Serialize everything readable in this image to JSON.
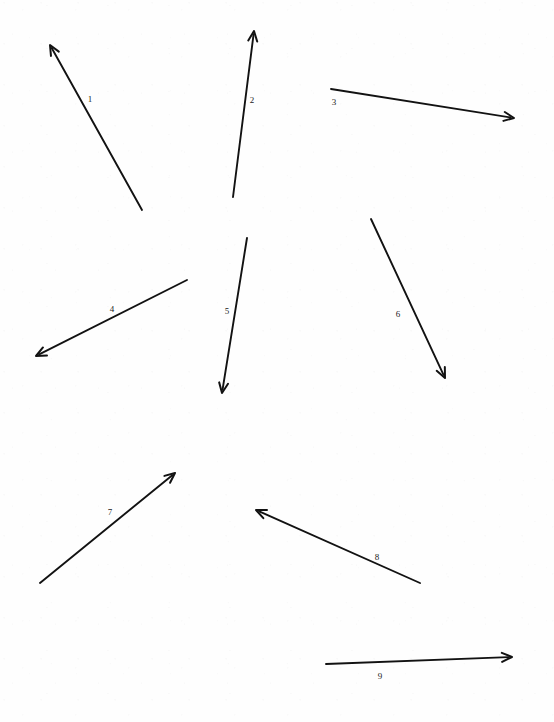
{
  "page": {
    "background_color": "#fefefe",
    "stroke_color": "#121212",
    "width": 554,
    "height": 722
  },
  "arrows": [
    {
      "id": "arrow-1",
      "label": "1",
      "label_x": 90,
      "label_y": 99,
      "tail_x": 142,
      "tail_y": 210,
      "head_x": 50,
      "head_y": 45,
      "direction": "up-left"
    },
    {
      "id": "arrow-2",
      "label": "2",
      "label_x": 252,
      "label_y": 100,
      "tail_x": 233,
      "tail_y": 197,
      "head_x": 254,
      "head_y": 31,
      "direction": "up"
    },
    {
      "id": "arrow-3",
      "label": "3",
      "label_x": 334,
      "label_y": 102,
      "tail_x": 331,
      "tail_y": 89,
      "head_x": 514,
      "head_y": 118,
      "direction": "right-down"
    },
    {
      "id": "arrow-4",
      "label": "4",
      "label_x": 112,
      "label_y": 309,
      "tail_x": 187,
      "tail_y": 280,
      "head_x": 36,
      "head_y": 356,
      "direction": "down-left"
    },
    {
      "id": "arrow-5",
      "label": "5",
      "label_x": 227,
      "label_y": 311,
      "tail_x": 247,
      "tail_y": 238,
      "head_x": 222,
      "head_y": 393,
      "direction": "down"
    },
    {
      "id": "arrow-6",
      "label": "6",
      "label_x": 398,
      "label_y": 314,
      "tail_x": 371,
      "tail_y": 219,
      "head_x": 445,
      "head_y": 378,
      "direction": "down-right"
    },
    {
      "id": "arrow-7",
      "label": "7",
      "label_x": 110,
      "label_y": 512,
      "tail_x": 40,
      "tail_y": 583,
      "head_x": 175,
      "head_y": 473,
      "direction": "up-right"
    },
    {
      "id": "arrow-8",
      "label": "8",
      "label_x": 377,
      "label_y": 557,
      "tail_x": 420,
      "tail_y": 583,
      "head_x": 256,
      "head_y": 510,
      "direction": "up-left"
    },
    {
      "id": "arrow-9",
      "label": "9",
      "label_x": 380,
      "label_y": 676,
      "tail_x": 326,
      "tail_y": 664,
      "head_x": 512,
      "head_y": 657,
      "direction": "right-up"
    }
  ]
}
